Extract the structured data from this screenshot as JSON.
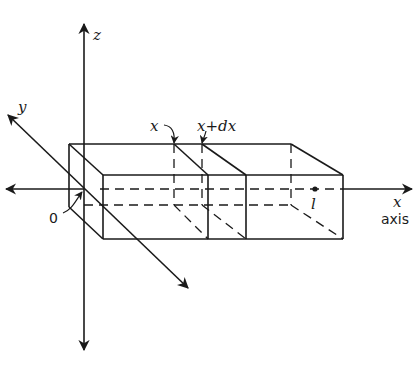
{
  "figure": {
    "type": "3d-bar-element-diagram",
    "stroke_color": "#1a1a1a",
    "background": "#ffffff"
  },
  "axes": {
    "z_label": "z",
    "y_label": "y",
    "x_label": "x",
    "x_sublabel": "axis"
  },
  "labels": {
    "origin": "0",
    "x_position": "x",
    "x_plus_dx": "x+dx",
    "length": "l"
  }
}
